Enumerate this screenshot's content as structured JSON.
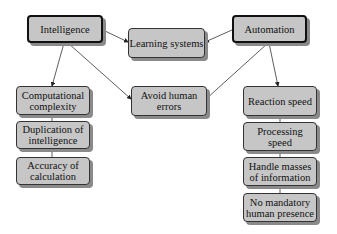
{
  "diagram": {
    "nodes": {
      "intelligence": "Intelligence",
      "learning": "Learning systems",
      "automation": "Automation",
      "computational": "Computational complexity",
      "avoid": "Avoid human errors",
      "reaction": "Reaction speed",
      "duplication": "Duplication of intelligence",
      "accuracy": "Accuracy of calculation",
      "processing": "Processing speed",
      "handle": "Handle masses of information",
      "nomandatory": "No mandatory human presence"
    },
    "edges": [
      {
        "from": "Intelligence",
        "to": "Learning systems"
      },
      {
        "from": "Automation",
        "to": "Learning systems"
      },
      {
        "from": "Intelligence",
        "to": "Computational complexity"
      },
      {
        "from": "Intelligence",
        "to": "Avoid human errors"
      },
      {
        "from": "Automation",
        "to": "Avoid human errors"
      },
      {
        "from": "Automation",
        "to": "Reaction speed"
      },
      {
        "from": "Computational complexity",
        "to": "Duplication of intelligence"
      },
      {
        "from": "Duplication of intelligence",
        "to": "Accuracy of calculation"
      },
      {
        "from": "Reaction speed",
        "to": "Processing speed"
      },
      {
        "from": "Processing speed",
        "to": "Handle masses of information"
      },
      {
        "from": "Handle masses of information",
        "to": "No mandatory human presence"
      }
    ],
    "colors": {
      "fill": "#c6c6c6",
      "border": "#333333",
      "shadow": "#8a8a8a"
    }
  }
}
